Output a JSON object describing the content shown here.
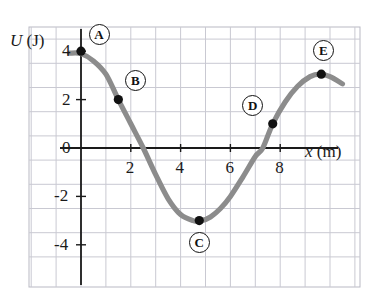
{
  "figure": {
    "kind": "potential-energy-curve"
  },
  "chart_data": {
    "type": "line",
    "title": "",
    "xlabel": "x (m)",
    "ylabel": "U (J)",
    "xlabel_parts": {
      "symbol": "x",
      "unit": "(m)"
    },
    "ylabel_parts": {
      "symbol": "U",
      "unit": "(J)"
    },
    "xlim": [
      -0.6,
      11.1
    ],
    "ylim": [
      -5.1,
      5.2
    ],
    "xticks": [
      2,
      4,
      6,
      8
    ],
    "yticks": [
      4,
      2,
      0,
      -2,
      -4
    ],
    "xtick_labels": [
      "2",
      "4",
      "6",
      "8"
    ],
    "ytick_labels": [
      "4",
      "2",
      "0",
      "-2",
      "-4"
    ],
    "grid": true,
    "grid_spacing_x": 1,
    "grid_spacing_y": 1,
    "legend": "none",
    "curve_color": "#8c8c8c",
    "axis_color": "#1a1a1a",
    "grid_color": "#c9c9d2",
    "marker_color": "#111111",
    "series": [
      {
        "name": "U(x)",
        "x": [
          -0.45,
          0.0,
          0.5,
          1.0,
          1.5,
          2.0,
          2.5,
          3.0,
          3.5,
          4.0,
          4.5,
          4.8,
          5.2,
          5.6,
          6.0,
          6.5,
          7.0,
          7.3,
          7.7,
          8.2,
          8.7,
          9.2,
          9.6,
          10.0,
          10.5
        ],
        "y": [
          3.92,
          3.9,
          3.6,
          3.05,
          2.0,
          1.0,
          0.0,
          -1.1,
          -2.1,
          -2.75,
          -3.0,
          -3.02,
          -2.85,
          -2.5,
          -2.0,
          -1.2,
          -0.35,
          0.0,
          1.0,
          1.9,
          2.55,
          2.95,
          3.05,
          2.95,
          2.65
        ]
      }
    ],
    "points": [
      {
        "id": "A",
        "label": "A",
        "x": 0.0,
        "y": 4.0,
        "badge_dx": 18,
        "badge_dy": -17
      },
      {
        "id": "B",
        "label": "B",
        "x": 1.5,
        "y": 2.0,
        "badge_dx": 17,
        "badge_dy": -19
      },
      {
        "id": "C",
        "label": "C",
        "x": 4.75,
        "y": -3.0,
        "badge_dx": 0,
        "badge_dy": 22
      },
      {
        "id": "D",
        "label": "D",
        "x": 7.7,
        "y": 1.0,
        "badge_dx": -20,
        "badge_dy": -18
      },
      {
        "id": "E",
        "label": "E",
        "x": 9.65,
        "y": 3.05,
        "badge_dx": 2,
        "badge_dy": -24
      }
    ]
  }
}
